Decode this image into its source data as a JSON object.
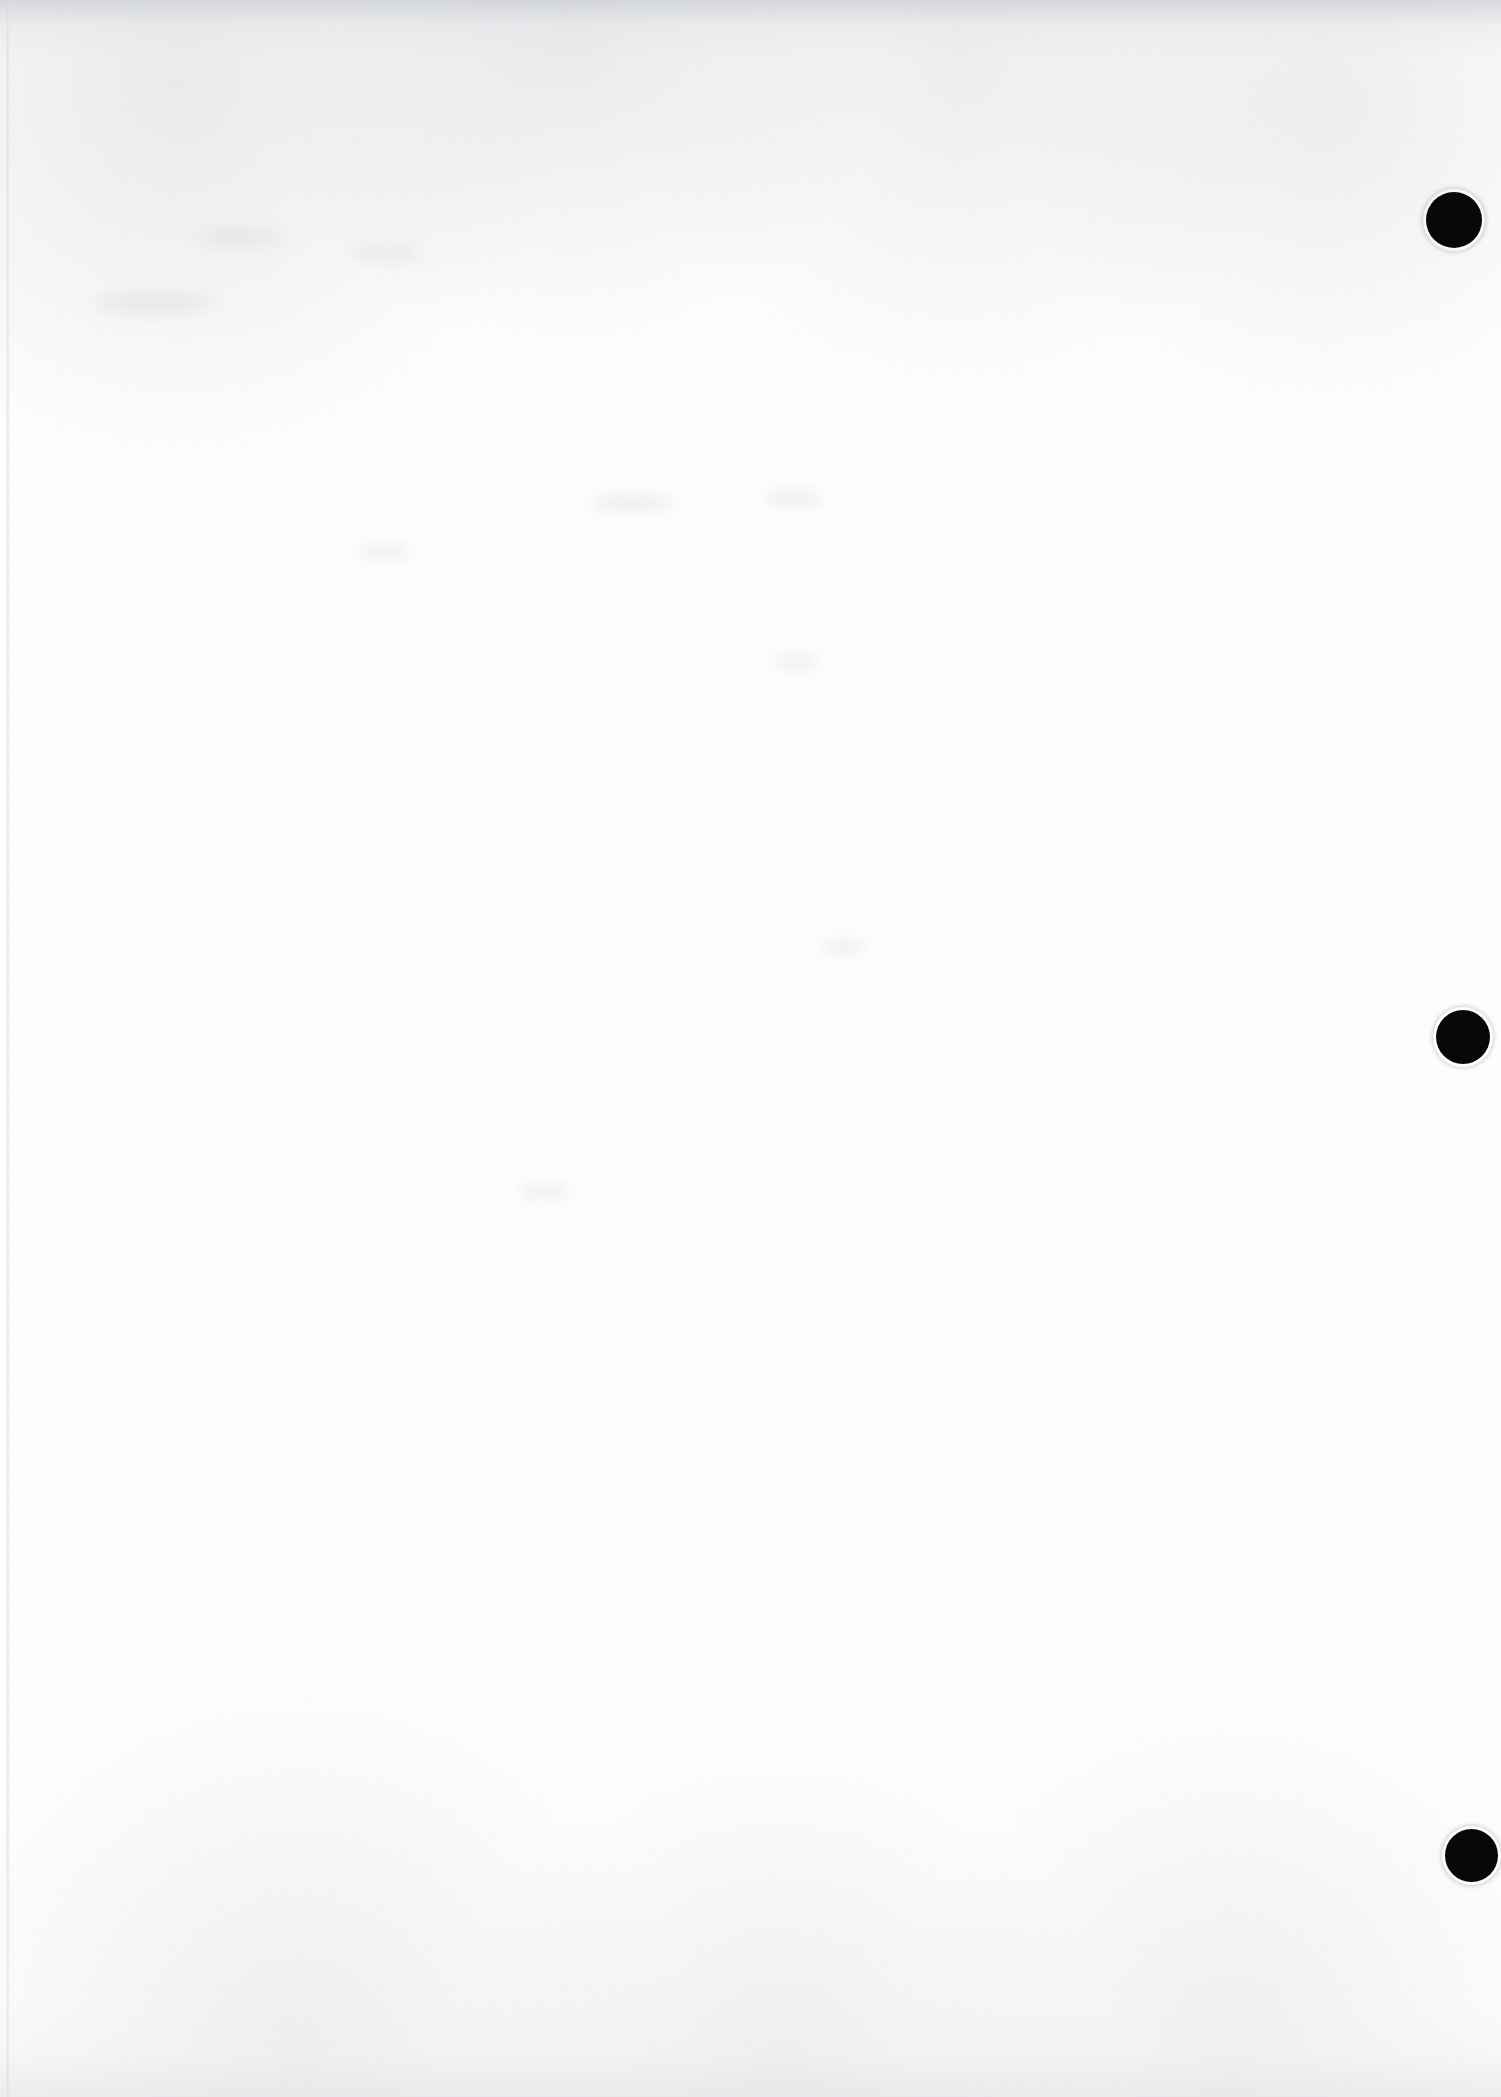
{
  "document": {
    "kind": "scanned-page",
    "page_label": "",
    "body_text": "",
    "width_px": 1501,
    "height_px": 2097,
    "background_color": "#fdfdfd",
    "ink_color": "#080808",
    "edge_shadow_color": "#c9ccd0",
    "grain_color": "#aaadb2"
  },
  "marks": {
    "label": "registration-dots",
    "count": 3,
    "color": "#080808",
    "items": [
      {
        "name": "registration-dot-top",
        "x": 1426,
        "y": 192,
        "diameter": 56
      },
      {
        "name": "registration-dot-middle",
        "x": 1436,
        "y": 1010,
        "diameter": 54
      },
      {
        "name": "registration-dot-bottom",
        "x": 1445,
        "y": 1829,
        "diameter": 53
      }
    ]
  },
  "ghosts": [
    {
      "x": 95,
      "y": 292,
      "w": 120,
      "h": 22
    },
    {
      "x": 196,
      "y": 228,
      "w": 90,
      "h": 18
    },
    {
      "x": 352,
      "y": 245,
      "w": 70,
      "h": 16
    },
    {
      "x": 590,
      "y": 494,
      "w": 86,
      "h": 18
    },
    {
      "x": 764,
      "y": 490,
      "w": 60,
      "h": 16
    },
    {
      "x": 358,
      "y": 545,
      "w": 54,
      "h": 14
    },
    {
      "x": 772,
      "y": 655,
      "w": 48,
      "h": 14
    },
    {
      "x": 822,
      "y": 940,
      "w": 44,
      "h": 14
    },
    {
      "x": 520,
      "y": 1185,
      "w": 52,
      "h": 14
    }
  ]
}
